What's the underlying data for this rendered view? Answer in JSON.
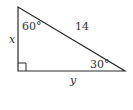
{
  "diagram": {
    "type": "right-triangle",
    "hypotenuse_label": "14",
    "vertical_leg_label": "x",
    "horizontal_leg_label": "y",
    "top_angle_label": "60°",
    "right_bottom_angle_label": "30°",
    "right_angle_marker": true,
    "colors": {
      "stroke": "#2a2a2a",
      "text": "#333333"
    }
  }
}
